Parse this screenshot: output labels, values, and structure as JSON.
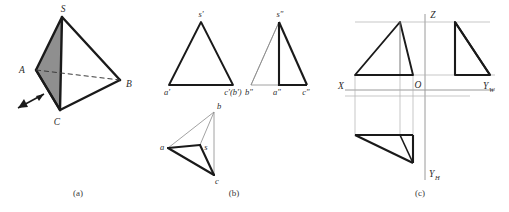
{
  "figure": {
    "background_color": "#ffffff",
    "stroke_color": "#1a1a1a",
    "thin_stroke_color": "#7a7a7a",
    "axis_color": "#8c8c8c",
    "shade_color": "#8f8f8f",
    "width": 509,
    "height": 212
  },
  "panels": [
    {
      "id": "a",
      "caption": "(a)",
      "caption_pos": {
        "x": 78,
        "y": 196
      },
      "description": "pictorial view of tetrahedron S-ABC with shaded face SAC and viewing-direction arrow",
      "vertices": [
        {
          "name": "S",
          "label": "S",
          "x": 62,
          "y": 17,
          "label_x": 63,
          "label_y": 12
        },
        {
          "name": "A",
          "label": "A",
          "x": 36,
          "y": 70,
          "label_x": 22,
          "label_y": 70
        },
        {
          "name": "B",
          "label": "B",
          "x": 120,
          "y": 80,
          "label_x": 127,
          "label_y": 84
        },
        {
          "name": "C",
          "label": "C",
          "x": 60,
          "y": 110,
          "label_x": 57,
          "label_y": 125
        }
      ],
      "shaded_face": [
        "S",
        "A",
        "C"
      ],
      "hidden_edge": [
        "A",
        "B"
      ],
      "arrow": {
        "name": "view-direction-arrow",
        "x1": 18,
        "y1": 108,
        "x2": 47,
        "y2": 92
      }
    },
    {
      "id": "b",
      "caption": "(b)",
      "caption_pos": {
        "x": 234,
        "y": 196
      },
      "description": "three orthographic projections: front (V), side (W), top (H)",
      "views": [
        {
          "name": "front-view",
          "labels": [
            {
              "text": "s'",
              "x": 199,
              "y": 16
            },
            {
              "text": "a'",
              "x": 164,
              "y": 94
            },
            {
              "text": "c'(b')",
              "x": 205,
              "y": 94
            }
          ]
        },
        {
          "name": "side-view",
          "labels": [
            {
              "text": "s\"",
              "x": 277,
              "y": 16
            },
            {
              "text": "b\"",
              "x": 248,
              "y": 94
            },
            {
              "text": "a\"",
              "x": 275,
              "y": 94
            },
            {
              "text": "c\"",
              "x": 303,
              "y": 94
            }
          ]
        },
        {
          "name": "top-view",
          "labels": [
            {
              "text": "a",
              "x": 162,
              "y": 146
            },
            {
              "text": "b",
              "x": 218,
              "y": 107
            },
            {
              "text": "c",
              "x": 215,
              "y": 180
            },
            {
              "text": "s",
              "x": 202,
              "y": 148
            }
          ]
        }
      ]
    },
    {
      "id": "c",
      "caption": "(c)",
      "caption_pos": {
        "x": 420,
        "y": 196
      },
      "description": "projection system with coordinate axes X, Z, Yw, Yh and origin O",
      "axes": [
        {
          "name": "axis-label-Z",
          "text": "Z",
          "x": 430,
          "y": 16
        },
        {
          "name": "axis-label-X",
          "text": "X",
          "x": 341,
          "y": 92
        },
        {
          "name": "axis-label-O",
          "text": "O",
          "x": 428,
          "y": 92
        },
        {
          "name": "axis-label-Yw",
          "text": "Y",
          "sub": "W",
          "x": 483,
          "y": 92
        },
        {
          "name": "axis-label-Yh",
          "text": "Y",
          "sub": "H",
          "x": 429,
          "y": 178
        }
      ]
    }
  ]
}
